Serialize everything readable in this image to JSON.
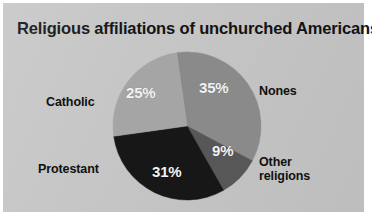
{
  "figure": {
    "background_color": "#c6c6c6",
    "border_color": "#ffffff",
    "title": "Religious affiliations of unchurched Americans",
    "title_color": "#131313"
  },
  "chart_data": {
    "type": "pie",
    "title": "Religious affiliations of unchurched Americans",
    "xlabel": "",
    "ylabel": "",
    "units": "percent",
    "total": 100,
    "legend_position": "outside-labels",
    "grid": false,
    "start_angle_deg": -8,
    "direction": "clockwise",
    "center": {
      "x": 187,
      "y": 126
    },
    "radius": 74,
    "categories": [
      "Nones",
      "Other religions",
      "Protestant",
      "Catholic"
    ],
    "values": [
      35,
      9,
      31,
      25
    ],
    "value_labels": [
      "35%",
      "9%",
      "31%",
      "25%"
    ],
    "colors": [
      "#8a8a8a",
      "#575757",
      "#171717",
      "#a5a5a5"
    ],
    "slices": [
      {
        "name": "Nones",
        "label": "Nones",
        "label_line1": "Nones",
        "label_line2": "",
        "value": 35,
        "value_label": "35%",
        "color": "#8a8a8a",
        "value_text_color": "#f2f2f2"
      },
      {
        "name": "Other religions",
        "label": "Other religions",
        "label_line1": "Other",
        "label_line2": "religions",
        "value": 9,
        "value_label": "9%",
        "color": "#575757",
        "value_text_color": "#f2f2f2"
      },
      {
        "name": "Protestant",
        "label": "Protestant",
        "label_line1": "Protestant",
        "label_line2": "",
        "value": 31,
        "value_label": "31%",
        "color": "#171717",
        "value_text_color": "#f2f2f2"
      },
      {
        "name": "Catholic",
        "label": "Catholic",
        "label_line1": "Catholic",
        "label_line2": "",
        "value": 25,
        "value_label": "25%",
        "color": "#a5a5a5",
        "value_text_color": "#f2f2f2"
      }
    ]
  }
}
